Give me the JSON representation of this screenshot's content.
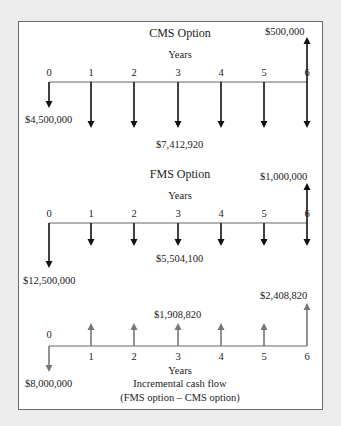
{
  "tick_x": [
    49,
    91,
    134,
    178,
    221,
    264,
    307
  ],
  "colors": {
    "background": "#ececec",
    "panel": "#ffffff",
    "border": "#6a6a6a",
    "arrow_black": "#111111",
    "arrow_gray": "#777777",
    "text": "#222222"
  },
  "diagrams": [
    {
      "name": "cms",
      "title": "CMS Option",
      "axis_label": "Years",
      "years": [
        "0",
        "1",
        "2",
        "3",
        "4",
        "5",
        "6"
      ],
      "axis_y": 82,
      "color": "#111111",
      "arrows": [
        {
          "year": 0,
          "dir": "down",
          "to": 108
        },
        {
          "year": 1,
          "dir": "down",
          "to": 128
        },
        {
          "year": 2,
          "dir": "down",
          "to": 128
        },
        {
          "year": 3,
          "dir": "down",
          "to": 128
        },
        {
          "year": 4,
          "dir": "down",
          "to": 128
        },
        {
          "year": 5,
          "dir": "down",
          "to": 128
        },
        {
          "year": 6,
          "dir": "down",
          "to": 128
        },
        {
          "year": 6,
          "dir": "up",
          "to": 37
        }
      ],
      "labels": [
        {
          "text": "$4,500,000",
          "x": 25,
          "y": 123
        },
        {
          "text": "$7,412,920",
          "x": 156,
          "y": 148
        },
        {
          "text": "$500,000",
          "x": 265,
          "y": 35
        }
      ]
    },
    {
      "name": "fms",
      "title": "FMS Option",
      "axis_label": "Years",
      "years": [
        "0",
        "1",
        "2",
        "3",
        "4",
        "5",
        "6"
      ],
      "axis_y": 223,
      "color": "#111111",
      "arrows": [
        {
          "year": 0,
          "dir": "down",
          "to": 268
        },
        {
          "year": 1,
          "dir": "down",
          "to": 246
        },
        {
          "year": 2,
          "dir": "down",
          "to": 246
        },
        {
          "year": 3,
          "dir": "down",
          "to": 246
        },
        {
          "year": 4,
          "dir": "down",
          "to": 246
        },
        {
          "year": 5,
          "dir": "down",
          "to": 246
        },
        {
          "year": 6,
          "dir": "down",
          "to": 246
        },
        {
          "year": 6,
          "dir": "up",
          "to": 183
        }
      ],
      "labels": [
        {
          "text": "$12,500,000",
          "x": 23,
          "y": 284
        },
        {
          "text": "$5,504,100",
          "x": 156,
          "y": 262
        },
        {
          "text": "$1,000,000",
          "x": 260,
          "y": 180
        }
      ]
    },
    {
      "name": "incremental",
      "title": "Incremental cash flow",
      "subtitle": "(FMS option – CMS option)",
      "axis_label": "Years",
      "years": [
        "0",
        "1",
        "2",
        "3",
        "4",
        "5",
        "6"
      ],
      "axis_y": 346,
      "color": "#777777",
      "arrows": [
        {
          "year": 0,
          "dir": "down",
          "to": 372
        },
        {
          "year": 1,
          "dir": "up",
          "to": 323
        },
        {
          "year": 2,
          "dir": "up",
          "to": 323
        },
        {
          "year": 3,
          "dir": "up",
          "to": 323
        },
        {
          "year": 4,
          "dir": "up",
          "to": 323
        },
        {
          "year": 5,
          "dir": "up",
          "to": 323
        },
        {
          "year": 6,
          "dir": "up",
          "to": 303
        }
      ],
      "labels": [
        {
          "text": "$8,000,000",
          "x": 25,
          "y": 387
        },
        {
          "text": "$1,908,820",
          "x": 154,
          "y": 318
        },
        {
          "text": "$2,408,820",
          "x": 260,
          "y": 299
        }
      ]
    }
  ],
  "chart_data": {
    "type": "cash-flow-diagram",
    "x": [
      0,
      1,
      2,
      3,
      4,
      5,
      6
    ],
    "xlabel": "Years",
    "series": [
      {
        "name": "CMS Option",
        "values": [
          -4500000,
          -7412920,
          -7412920,
          -7412920,
          -7412920,
          -7412920,
          -6912920
        ],
        "notes": "Year 6: outflow $7,412,920 and inflow $500,000"
      },
      {
        "name": "FMS Option",
        "values": [
          -12500000,
          -5504100,
          -5504100,
          -5504100,
          -5504100,
          -5504100,
          -4504100
        ],
        "notes": "Year 6: outflow $5,504,100 and inflow $1,000,000"
      },
      {
        "name": "Incremental cash flow (FMS option – CMS option)",
        "values": [
          -8000000,
          1908820,
          1908820,
          1908820,
          1908820,
          1908820,
          2408820
        ]
      }
    ]
  }
}
